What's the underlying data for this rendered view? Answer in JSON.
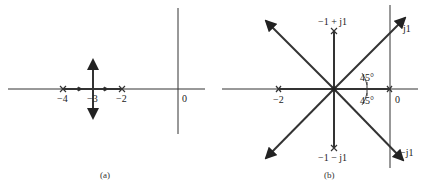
{
  "figure": {
    "panel_a": {
      "label": "(a)",
      "ticks": [
        "−4",
        "−3",
        "−2",
        "0"
      ],
      "poles": [
        -4,
        -2
      ],
      "breakaway": -3
    },
    "panel_b": {
      "label": "(b)",
      "ticks": [
        "−2",
        "0"
      ],
      "pole_upper": "−1 + j1",
      "pole_lower": "−1 − j1",
      "asymptote_upper": "j1",
      "asymptote_lower": "−j1",
      "angle_upper": "45°",
      "angle_lower": "45°"
    }
  }
}
